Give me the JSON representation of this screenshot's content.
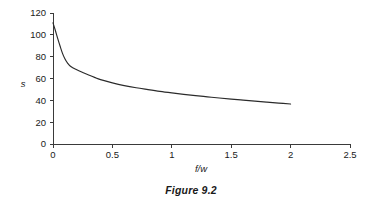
{
  "caption": "Figure 9.2",
  "chart_data": {
    "type": "line",
    "title": "",
    "subtitle": "",
    "xlabel": "f/w",
    "ylabel": "s",
    "xlim": [
      0,
      2.5
    ],
    "ylim": [
      0,
      120
    ],
    "grid": false,
    "legend": null,
    "legend_position": "none",
    "x_ticks": [
      0,
      0.5,
      1,
      1.5,
      2,
      2.5
    ],
    "x_tick_labels": [
      "0",
      "0.5",
      "1",
      "1.5",
      "2",
      "2.5"
    ],
    "y_ticks": [
      0,
      20,
      40,
      60,
      80,
      100,
      120
    ],
    "y_tick_labels": [
      "0",
      "20",
      "40",
      "60",
      "80",
      "100",
      "120"
    ],
    "line_color": "#2b2b2b",
    "axis_color": "#3a3a3a",
    "background_color": "#ffffff",
    "series": [
      {
        "name": "s",
        "x": [
          0.0,
          0.02,
          0.04,
          0.06,
          0.08,
          0.1,
          0.12,
          0.15,
          0.2,
          0.25,
          0.3,
          0.35,
          0.4,
          0.5,
          0.6,
          0.7,
          0.8,
          0.9,
          1.0,
          1.1,
          1.2,
          1.3,
          1.4,
          1.5,
          1.6,
          1.7,
          1.8,
          1.9,
          2.0
        ],
        "y": [
          111.0,
          104.0,
          96.5,
          89.5,
          83.0,
          78.0,
          74.5,
          71.0,
          68.0,
          65.5,
          63.2,
          61.0,
          59.0,
          56.0,
          53.5,
          51.5,
          49.8,
          48.2,
          46.8,
          45.5,
          44.3,
          43.2,
          42.1,
          41.1,
          40.2,
          39.3,
          38.4,
          37.5,
          36.6
        ]
      }
    ],
    "annotations": []
  }
}
